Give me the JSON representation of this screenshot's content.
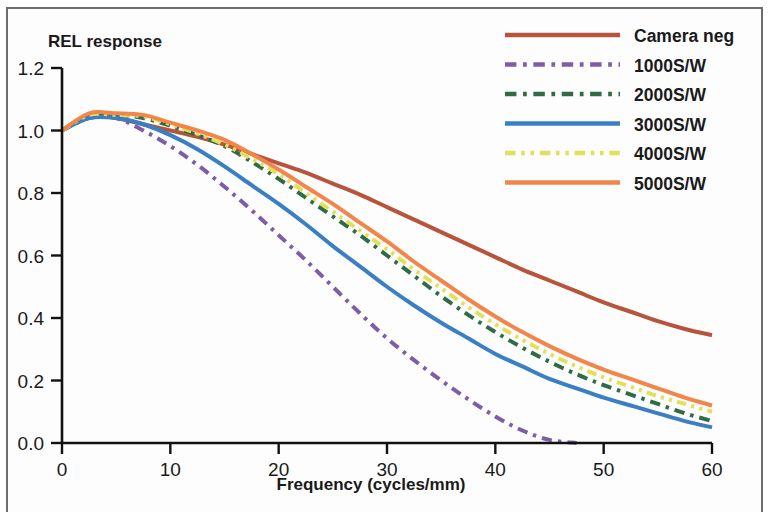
{
  "chart_data": {
    "type": "line",
    "title": "",
    "ylabel": "REL response",
    "xlabel": "Frequency (cycles/mm)",
    "xlim": [
      0,
      60
    ],
    "ylim": [
      0.0,
      1.2
    ],
    "xticks": [
      0,
      10,
      20,
      30,
      40,
      50,
      60
    ],
    "xtick_labels": [
      "0",
      "10",
      "20",
      "30",
      "40",
      "50",
      "60"
    ],
    "yticks": [
      0.0,
      0.2,
      0.4,
      0.6,
      0.8,
      1.0,
      1.2
    ],
    "ytick_labels": [
      "0.0",
      "0.2",
      "0.4",
      "0.6",
      "0.8",
      "1.0",
      "1.2"
    ],
    "grid": false,
    "legend_position": "top-right",
    "x": [
      0,
      2.5,
      5,
      7.5,
      10,
      12.5,
      15,
      17.5,
      20,
      22.5,
      25,
      27.5,
      30,
      32.5,
      35,
      37.5,
      40,
      42.5,
      45,
      47.5,
      50,
      52.5,
      55,
      57.5,
      60
    ],
    "series": [
      {
        "name": "Camera neg",
        "color": "#b8543c",
        "dash": "solid",
        "values": [
          1.0,
          1.05,
          1.04,
          1.02,
          1.0,
          0.98,
          0.955,
          0.925,
          0.895,
          0.865,
          0.83,
          0.795,
          0.755,
          0.715,
          0.675,
          0.635,
          0.595,
          0.555,
          0.52,
          0.485,
          0.45,
          0.42,
          0.39,
          0.365,
          0.345
        ]
      },
      {
        "name": "1000S/W",
        "color": "#7b5ea7",
        "dash": "dash-dot",
        "values": [
          1.0,
          1.04,
          1.04,
          1.0,
          0.95,
          0.89,
          0.82,
          0.745,
          0.665,
          0.585,
          0.5,
          0.415,
          0.335,
          0.265,
          0.2,
          0.14,
          0.085,
          0.04,
          0.01,
          0.0,
          0.0,
          0.0,
          0.0,
          0.0,
          0.0
        ]
      },
      {
        "name": "2000S/W",
        "color": "#2f6b46",
        "dash": "dash-dot",
        "values": [
          1.0,
          1.05,
          1.05,
          1.04,
          1.015,
          0.985,
          0.95,
          0.9,
          0.845,
          0.785,
          0.725,
          0.665,
          0.6,
          0.535,
          0.47,
          0.41,
          0.355,
          0.305,
          0.26,
          0.22,
          0.185,
          0.155,
          0.125,
          0.095,
          0.07
        ]
      },
      {
        "name": "3000S/W",
        "color": "#3a7fc4",
        "dash": "solid",
        "values": [
          1.0,
          1.04,
          1.04,
          1.02,
          0.985,
          0.94,
          0.885,
          0.825,
          0.765,
          0.7,
          0.63,
          0.565,
          0.5,
          0.44,
          0.385,
          0.335,
          0.285,
          0.245,
          0.205,
          0.175,
          0.145,
          0.12,
          0.095,
          0.07,
          0.05
        ]
      },
      {
        "name": "4000S/W",
        "color": "#e2e05a",
        "dash": "dash-dot-dot",
        "values": [
          1.0,
          1.05,
          1.05,
          1.045,
          1.02,
          0.99,
          0.955,
          0.91,
          0.86,
          0.8,
          0.74,
          0.68,
          0.62,
          0.555,
          0.495,
          0.435,
          0.38,
          0.33,
          0.285,
          0.245,
          0.21,
          0.18,
          0.15,
          0.125,
          0.1
        ]
      },
      {
        "name": "5000S/W",
        "color": "#f2864a",
        "dash": "solid",
        "values": [
          1.0,
          1.055,
          1.055,
          1.05,
          1.025,
          1.0,
          0.97,
          0.925,
          0.875,
          0.82,
          0.765,
          0.705,
          0.645,
          0.58,
          0.52,
          0.46,
          0.405,
          0.355,
          0.31,
          0.27,
          0.235,
          0.205,
          0.175,
          0.145,
          0.12
        ]
      }
    ]
  },
  "legend": {
    "entries": [
      {
        "label": "Camera neg"
      },
      {
        "label": "1000S/W"
      },
      {
        "label": "2000S/W"
      },
      {
        "label": "3000S/W"
      },
      {
        "label": "4000S/W"
      },
      {
        "label": "5000S/W"
      }
    ]
  }
}
